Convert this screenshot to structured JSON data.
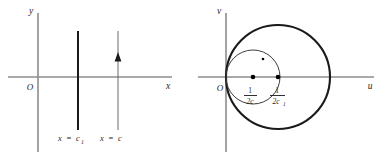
{
  "figure": {
    "background_color": "#ffffff",
    "axis_color": "#8c8c8c",
    "curve_color": "#1a1a1a",
    "width": 386,
    "height": 160
  },
  "left_panel": {
    "name": "z-plane",
    "origin_label": "O",
    "vertical_axis_label": "y",
    "horizontal_axis_label": "x",
    "lines": [
      {
        "id": "line-c1",
        "style": "thick",
        "has_arrow": false,
        "label_prefix": "x",
        "label_equals": "=",
        "label_base": "c",
        "label_subscript": "1",
        "label_full": "x = c1"
      },
      {
        "id": "line-c",
        "style": "thin",
        "has_arrow": true,
        "arrow_direction": "up",
        "label_prefix": "x",
        "label_equals": "=",
        "label_base": "c",
        "label_subscript": "",
        "label_full": "x = c"
      }
    ]
  },
  "right_panel": {
    "name": "w-plane",
    "origin_label": "O",
    "vertical_axis_label": "v",
    "horizontal_axis_label": "u",
    "circles": [
      {
        "id": "circle-small",
        "style": "thin",
        "tangent_at": "origin",
        "center_label_numerator": "1",
        "center_label_denominator_base": "2c",
        "center_label_denominator_sub": "",
        "center_label_full": "1/(2c)",
        "has_center_dot": true,
        "has_arc_dot": true
      },
      {
        "id": "circle-large",
        "style": "thick",
        "tangent_at": "origin",
        "center_label_numerator": "1",
        "center_label_denominator_base": "2c",
        "center_label_denominator_sub": "1",
        "center_label_full": "1/(2c1)",
        "has_center_dot": true,
        "has_arc_dot": false
      }
    ]
  }
}
